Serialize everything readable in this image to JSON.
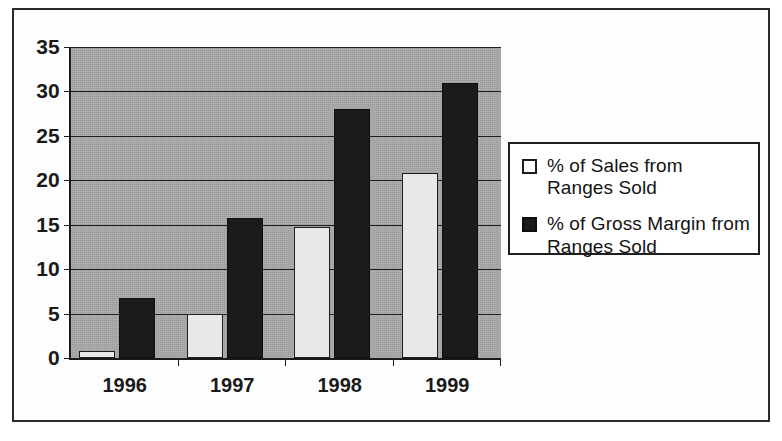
{
  "chart_data": {
    "type": "bar",
    "title": "",
    "subtitle": "",
    "xlabel": "",
    "ylabel": "",
    "categories": [
      "1996",
      "1997",
      "1998",
      "1999"
    ],
    "series": [
      {
        "name": "% of Sales from Ranges Sold",
        "legend_line1": "% of Sales from",
        "legend_line2": "Ranges Sold",
        "color": "#e8e8e8",
        "values": [
          0.8,
          5.0,
          14.8,
          20.8
        ]
      },
      {
        "name": "% of Gross Margin from Ranges Sold",
        "legend_line1": "% of Gross Margin from",
        "legend_line2": "Ranges Sold",
        "color": "#1b1b1b",
        "values": [
          6.8,
          15.8,
          28.0,
          31.0
        ]
      }
    ],
    "ylim": [
      0,
      35
    ],
    "ytick_step": 5,
    "yticks": [
      "35",
      "30",
      "25",
      "20",
      "15",
      "10",
      "5",
      "0"
    ],
    "grid": true,
    "legend_position": "right",
    "plot_background": "#a9a9a9",
    "frame_color": "#2b2b2b"
  }
}
